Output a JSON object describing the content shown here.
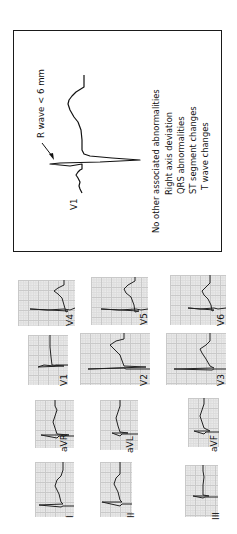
{
  "figure": {
    "orientation": "rotated-90-ccw",
    "inset": {
      "lead_label": "V1",
      "annotation": "R wave < 6 mm",
      "heading": "No other associated abnormalities",
      "criteria": [
        "Right axis deviation",
        "QRS abnormalities",
        "ST segment changes",
        "T wave changes"
      ]
    },
    "leads": [
      {
        "label": "V4"
      },
      {
        "label": "V5"
      },
      {
        "label": "V6"
      },
      {
        "label": "V1"
      },
      {
        "label": "V2"
      },
      {
        "label": "V3"
      },
      {
        "label": "aVR"
      },
      {
        "label": "aVL"
      },
      {
        "label": "aVF"
      },
      {
        "label": "I"
      },
      {
        "label": "II"
      },
      {
        "label": "III"
      }
    ],
    "colors": {
      "trace": "#222222",
      "grid_bg": "#e9e9e9",
      "grid_major": "#c9c9c9",
      "border": "#1a1a1a"
    }
  }
}
